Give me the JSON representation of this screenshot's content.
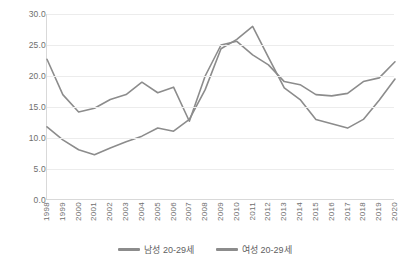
{
  "chart_data": {
    "type": "line",
    "title": "",
    "subtitle": "",
    "xlabel": "",
    "ylabel": "",
    "ylim": [
      0.0,
      30.0
    ],
    "y_ticks": [
      "0.0",
      "5.0",
      "10.0",
      "15.0",
      "20.0",
      "25.0",
      "30.0"
    ],
    "grid": true,
    "legend_position": "bottom",
    "categories": [
      "1998",
      "1999",
      "2000",
      "2001",
      "2002",
      "2003",
      "2004",
      "2005",
      "2006",
      "2007",
      "2008",
      "2009",
      "2010",
      "2011",
      "2012",
      "2013",
      "2014",
      "2015",
      "2016",
      "2017",
      "2018",
      "2019",
      "2020"
    ],
    "series": [
      {
        "name": "남성 20-29세",
        "color": "#8c8c8c",
        "values": [
          22.7,
          17.0,
          14.2,
          14.8,
          16.2,
          17.0,
          19.0,
          17.3,
          18.2,
          12.7,
          20.0,
          25.0,
          25.6,
          23.4,
          21.8,
          19.1,
          18.6,
          17.0,
          16.8,
          17.2,
          19.1,
          19.7,
          22.3
        ]
      },
      {
        "name": "여성 20-29세",
        "color": "#8c8c8c",
        "values": [
          11.8,
          9.7,
          8.1,
          7.3,
          8.4,
          9.4,
          10.3,
          11.6,
          11.1,
          13.0,
          17.8,
          24.4,
          25.9,
          28.0,
          23.0,
          18.1,
          16.2,
          13.0,
          12.3,
          11.6,
          13.0,
          16.1,
          19.5
        ]
      }
    ]
  },
  "legend": {
    "items": [
      {
        "label": "남성 20-29세"
      },
      {
        "label": "여성 20-29세"
      }
    ]
  },
  "axis": {
    "y_min_label": "0.0",
    "y_max_label": "30.0"
  },
  "colors": {
    "line": "#8c8c8c",
    "gridline": "#ececec",
    "axis": "#d9d9d9",
    "tick_text": "#6e6e6e",
    "legend_text": "#5f5f5f",
    "background": "#ffffff"
  }
}
